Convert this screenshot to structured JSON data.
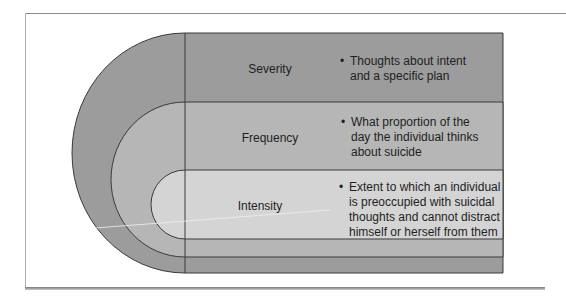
{
  "diagram": {
    "levels": [
      {
        "name": "Severity",
        "description": "Thoughts about intent and a specific plan",
        "description_lines": [
          "Thoughts about intent",
          "and a specific plan"
        ],
        "fill": "#9c9c9c"
      },
      {
        "name": "Frequency",
        "description": "What proportion of the day the individual thinks about suicide",
        "description_lines": [
          "What proportion of the",
          "day the individual thinks",
          "about suicide"
        ],
        "fill": "#b6b6b6"
      },
      {
        "name": "Intensity",
        "description": "Extent to which an individual is preoccupied with suicidal thoughts and cannot distract himself or herself from them",
        "description_lines": [
          "Extent to which an individual",
          "is preoccupied with suicidal",
          "thoughts and cannot distract",
          "himself or herself from them"
        ],
        "fill": "#d4d4d4"
      }
    ],
    "bullet": "•",
    "line_color": "#3a3a3a"
  }
}
